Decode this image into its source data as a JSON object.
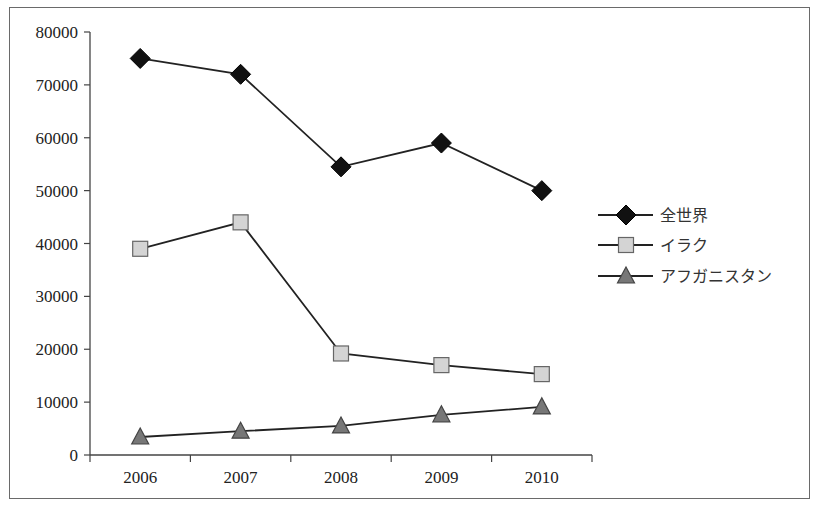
{
  "chart_data": {
    "type": "line",
    "title": "",
    "xlabel": "",
    "ylabel": "",
    "categories": [
      "2006",
      "2007",
      "2008",
      "2009",
      "2010"
    ],
    "ylim": [
      0,
      80000
    ],
    "yticks": [
      0,
      10000,
      20000,
      30000,
      40000,
      50000,
      60000,
      70000,
      80000
    ],
    "grid": false,
    "legend_position": "right",
    "series": [
      {
        "name": "全世界",
        "marker": "diamond",
        "color": "#111111",
        "values": [
          75000,
          72000,
          54500,
          59000,
          50000
        ]
      },
      {
        "name": "イラク",
        "marker": "square",
        "color": "#d4d4d4",
        "values": [
          39000,
          44000,
          19200,
          17000,
          15300
        ]
      },
      {
        "name": "アフガニスタン",
        "marker": "triangle",
        "color": "#777777",
        "values": [
          3400,
          4500,
          5500,
          7600,
          9100
        ]
      }
    ]
  }
}
